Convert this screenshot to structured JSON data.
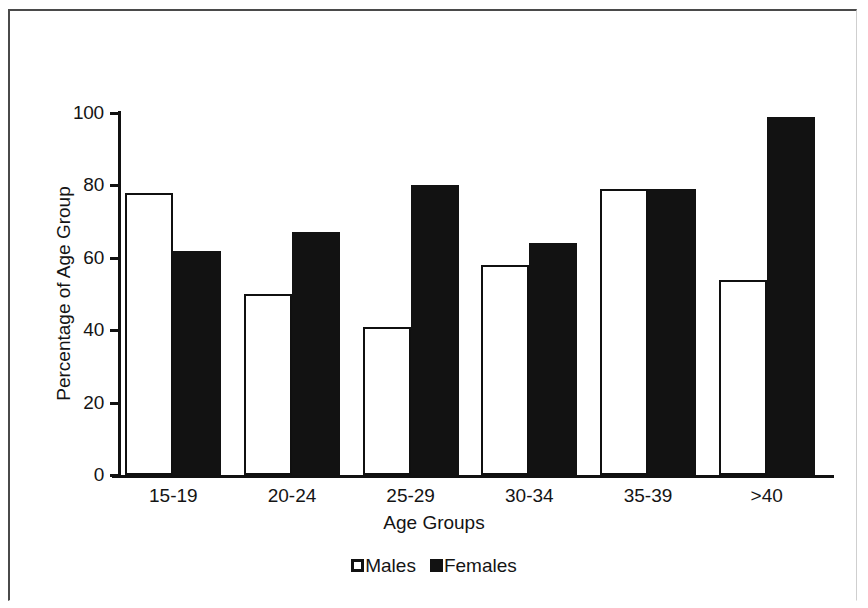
{
  "chart_data": {
    "type": "bar",
    "title": "",
    "xlabel": "Age Groups",
    "ylabel": "Percentage of Age Group",
    "categories": [
      "15-19",
      "20-24",
      "25-29",
      "30-34",
      "35-39",
      ">40"
    ],
    "series": [
      {
        "name": "Males",
        "color": "#ffffff",
        "values": [
          78,
          50,
          41,
          58,
          79,
          54
        ]
      },
      {
        "name": "Females",
        "color": "#121212",
        "values": [
          62,
          67,
          80,
          64,
          79,
          99
        ]
      }
    ],
    "ylim": [
      0,
      100
    ],
    "yticks": [
      0,
      20,
      40,
      60,
      80,
      100
    ],
    "ytick_labels": [
      "0",
      "20",
      "40",
      "60",
      "80",
      "100"
    ],
    "grid": false,
    "legend_position": "bottom"
  },
  "axes": {
    "y_title": "Percentage of Age Group",
    "x_title": "Age Groups"
  },
  "legend": {
    "entries": [
      {
        "label": "Males"
      },
      {
        "label": "Females"
      }
    ]
  },
  "colors": {
    "males_fill": "#ffffff",
    "females_fill": "#121212",
    "axis": "#111111",
    "text": "#141414",
    "frame": "#4a4a4a",
    "background": "#ffffff"
  }
}
